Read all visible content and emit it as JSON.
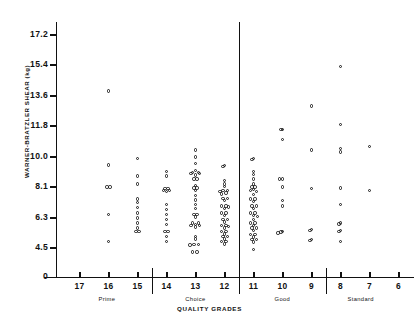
{
  "chart_data": {
    "type": "scatter",
    "title": "",
    "xlabel": "QUALITY GRADES",
    "ylabel": "WARNER-BRATZLER SHEAR (kg)",
    "ylim": [
      3.6,
      18.1
    ],
    "yticks": [
      0,
      4.5,
      6.3,
      8.1,
      10.0,
      11.8,
      13.6,
      15.4,
      17.2
    ],
    "ytick_labels": [
      "0",
      "4.5",
      "6.3",
      "8.1",
      "10.0",
      "11.8",
      "13.6",
      "15.4",
      "17.2"
    ],
    "xlim": [
      17.6,
      5.6
    ],
    "xticks": [
      17,
      16,
      15,
      14,
      13,
      12,
      11,
      10,
      9,
      8,
      7,
      6
    ],
    "xtick_labels": [
      "17",
      "16",
      "15",
      "14",
      "13",
      "12",
      "11",
      "10",
      "9",
      "8",
      "7",
      "6"
    ],
    "x_axis_reversed": true,
    "grid": false,
    "legend": false,
    "grade_groups": [
      {
        "label": "Prime",
        "start": 17.6,
        "end": 14.5,
        "center": 16.05
      },
      {
        "label": "Choice",
        "start": 14.5,
        "end": 11.5,
        "center": 13.0
      },
      {
        "label": "Good",
        "start": 11.5,
        "end": 8.5,
        "center": 10.0
      },
      {
        "label": "Standard",
        "start": 8.5,
        "end": 5.6,
        "center": 7.3
      }
    ],
    "reference_line": {
      "type": "regression",
      "y_left": 8.15,
      "y_right": 7.95,
      "label": ""
    },
    "series": [
      {
        "name": "carcass",
        "marker": "open-circle",
        "points": [
          [
            16.0,
            13.9
          ],
          [
            16.0,
            9.5
          ],
          [
            16.05,
            8.1
          ],
          [
            15.95,
            8.1
          ],
          [
            16.0,
            6.5
          ],
          [
            16.0,
            4.9
          ],
          [
            15.0,
            9.9
          ],
          [
            15.0,
            8.8
          ],
          [
            15.0,
            8.3
          ],
          [
            15.0,
            7.4
          ],
          [
            15.0,
            7.2
          ],
          [
            15.0,
            6.9
          ],
          [
            15.0,
            6.6
          ],
          [
            15.0,
            6.3
          ],
          [
            15.0,
            6.0
          ],
          [
            15.0,
            5.7
          ],
          [
            14.95,
            5.5
          ],
          [
            15.05,
            5.5
          ],
          [
            14.0,
            9.1
          ],
          [
            14.0,
            8.8
          ],
          [
            14.05,
            8.0
          ],
          [
            13.95,
            8.0
          ],
          [
            14.1,
            7.9
          ],
          [
            13.9,
            7.9
          ],
          [
            14.0,
            7.85
          ],
          [
            14.0,
            7.1
          ],
          [
            14.0,
            6.8
          ],
          [
            14.0,
            6.5
          ],
          [
            14.0,
            6.2
          ],
          [
            14.0,
            5.9
          ],
          [
            14.05,
            5.5
          ],
          [
            13.95,
            5.5
          ],
          [
            14.0,
            5.2
          ],
          [
            14.0,
            4.9
          ],
          [
            13.0,
            10.4
          ],
          [
            13.0,
            10.0
          ],
          [
            13.0,
            9.6
          ],
          [
            13.0,
            9.15
          ],
          [
            12.9,
            9.0
          ],
          [
            13.1,
            9.0
          ],
          [
            12.85,
            8.95
          ],
          [
            13.15,
            8.95
          ],
          [
            13.0,
            8.85
          ],
          [
            12.95,
            8.6
          ],
          [
            13.05,
            8.6
          ],
          [
            13.0,
            8.2
          ],
          [
            12.95,
            8.05
          ],
          [
            13.05,
            8.05
          ],
          [
            13.0,
            7.9
          ],
          [
            13.0,
            7.6
          ],
          [
            13.0,
            7.35
          ],
          [
            13.0,
            7.1
          ],
          [
            13.0,
            6.85
          ],
          [
            12.95,
            6.5
          ],
          [
            13.05,
            6.5
          ],
          [
            13.0,
            6.35
          ],
          [
            12.9,
            6.0
          ],
          [
            13.1,
            6.0
          ],
          [
            13.0,
            5.9
          ],
          [
            12.85,
            5.85
          ],
          [
            13.15,
            5.85
          ],
          [
            13.0,
            5.75
          ],
          [
            13.0,
            5.2
          ],
          [
            13.0,
            5.05
          ],
          [
            12.9,
            4.7
          ],
          [
            13.05,
            4.7
          ],
          [
            13.18,
            4.68
          ],
          [
            12.95,
            4.25
          ],
          [
            13.1,
            4.25
          ],
          [
            12.0,
            9.45
          ],
          [
            12.05,
            9.4
          ],
          [
            12.0,
            8.5
          ],
          [
            12.0,
            8.3
          ],
          [
            12.0,
            8.15
          ],
          [
            11.9,
            7.9
          ],
          [
            12.05,
            7.9
          ],
          [
            12.15,
            7.85
          ],
          [
            11.95,
            7.75
          ],
          [
            12.1,
            7.7
          ],
          [
            11.9,
            7.45
          ],
          [
            12.05,
            7.45
          ],
          [
            12.0,
            7.3
          ],
          [
            11.95,
            7.0
          ],
          [
            12.1,
            7.0
          ],
          [
            11.85,
            6.95
          ],
          [
            12.0,
            6.85
          ],
          [
            11.95,
            6.6
          ],
          [
            12.1,
            6.6
          ],
          [
            12.0,
            6.45
          ],
          [
            11.9,
            6.2
          ],
          [
            12.05,
            6.2
          ],
          [
            12.0,
            6.05
          ],
          [
            11.95,
            5.85
          ],
          [
            12.1,
            5.85
          ],
          [
            11.85,
            5.8
          ],
          [
            12.0,
            5.7
          ],
          [
            11.95,
            5.5
          ],
          [
            12.1,
            5.5
          ],
          [
            12.0,
            5.35
          ],
          [
            11.9,
            5.2
          ],
          [
            12.05,
            5.2
          ],
          [
            12.0,
            5.05
          ],
          [
            11.95,
            4.9
          ],
          [
            12.1,
            4.9
          ],
          [
            12.0,
            4.75
          ],
          [
            11.0,
            9.9
          ],
          [
            11.05,
            9.85
          ],
          [
            11.0,
            9.1
          ],
          [
            11.0,
            8.9
          ],
          [
            11.0,
            8.6
          ],
          [
            11.0,
            8.3
          ],
          [
            10.95,
            8.1
          ],
          [
            11.05,
            8.1
          ],
          [
            11.0,
            7.95
          ],
          [
            11.1,
            7.9
          ],
          [
            10.9,
            7.85
          ],
          [
            11.0,
            7.65
          ],
          [
            10.95,
            7.4
          ],
          [
            11.1,
            7.4
          ],
          [
            11.0,
            7.25
          ],
          [
            10.9,
            7.0
          ],
          [
            11.05,
            7.0
          ],
          [
            11.0,
            6.85
          ],
          [
            10.95,
            6.6
          ],
          [
            11.1,
            6.6
          ],
          [
            11.0,
            6.45
          ],
          [
            10.85,
            6.4
          ],
          [
            11.0,
            6.2
          ],
          [
            10.95,
            6.0
          ],
          [
            11.1,
            6.0
          ],
          [
            11.0,
            5.85
          ],
          [
            10.9,
            5.7
          ],
          [
            11.05,
            5.7
          ],
          [
            11.0,
            5.55
          ],
          [
            10.95,
            5.3
          ],
          [
            11.1,
            5.3
          ],
          [
            11.0,
            5.15
          ],
          [
            10.9,
            5.0
          ],
          [
            11.05,
            5.0
          ],
          [
            11.0,
            4.85
          ],
          [
            11.0,
            4.4
          ],
          [
            10.0,
            11.6
          ],
          [
            10.05,
            11.6
          ],
          [
            10.0,
            11.0
          ],
          [
            10.0,
            8.6
          ],
          [
            10.1,
            8.6
          ],
          [
            10.0,
            8.1
          ],
          [
            10.0,
            7.3
          ],
          [
            10.0,
            7.0
          ],
          [
            10.0,
            5.5
          ],
          [
            10.05,
            5.45
          ],
          [
            10.15,
            5.4
          ],
          [
            9.0,
            13.0
          ],
          [
            9.0,
            10.4
          ],
          [
            9.0,
            8.0
          ],
          [
            9.0,
            5.6
          ],
          [
            9.05,
            5.55
          ],
          [
            9.0,
            5.0
          ],
          [
            9.05,
            4.95
          ],
          [
            8.0,
            15.3
          ],
          [
            8.0,
            11.9
          ],
          [
            8.0,
            10.5
          ],
          [
            8.0,
            10.3
          ],
          [
            8.0,
            8.05
          ],
          [
            8.0,
            7.1
          ],
          [
            8.0,
            6.0
          ],
          [
            8.05,
            5.95
          ],
          [
            8.0,
            5.55
          ],
          [
            8.05,
            5.5
          ],
          [
            8.0,
            4.9
          ],
          [
            7.0,
            10.6
          ],
          [
            7.0,
            7.9
          ]
        ]
      }
    ]
  }
}
